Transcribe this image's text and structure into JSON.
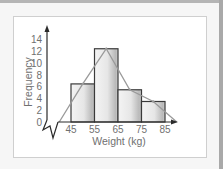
{
  "chart_data": {
    "type": "bar",
    "subtype": "histogram_with_frequency_polygon",
    "title": "",
    "xlabel": "Weight (kg)",
    "ylabel": "Frequency",
    "x_ticks": [
      "45",
      "55",
      "65",
      "75",
      "85"
    ],
    "y_ticks": [
      "0",
      "2",
      "4",
      "6",
      "8",
      "10",
      "12",
      "14"
    ],
    "ylim": [
      0,
      14
    ],
    "categories": [
      "45-55",
      "55-65",
      "65-75",
      "75-85"
    ],
    "bins": [
      {
        "from": 45,
        "to": 55,
        "frequency": 6.5
      },
      {
        "from": 55,
        "to": 65,
        "frequency": 12.5
      },
      {
        "from": 65,
        "to": 75,
        "frequency": 5.5
      },
      {
        "from": 75,
        "to": 85,
        "frequency": 3.5
      }
    ],
    "values": [
      6.5,
      12.5,
      5.5,
      3.5
    ],
    "frequency_polygon": {
      "x": [
        40,
        50,
        60,
        70,
        80,
        90
      ],
      "y": [
        0,
        6.5,
        12.5,
        5.5,
        3.5,
        0
      ]
    },
    "axis_break": true,
    "grid": false,
    "legend": "none",
    "colors": {
      "bar_stroke": "#3a3a3a",
      "polygon": "#9a9a9a",
      "axis": "#2a2a2a",
      "text": "#707070"
    }
  }
}
